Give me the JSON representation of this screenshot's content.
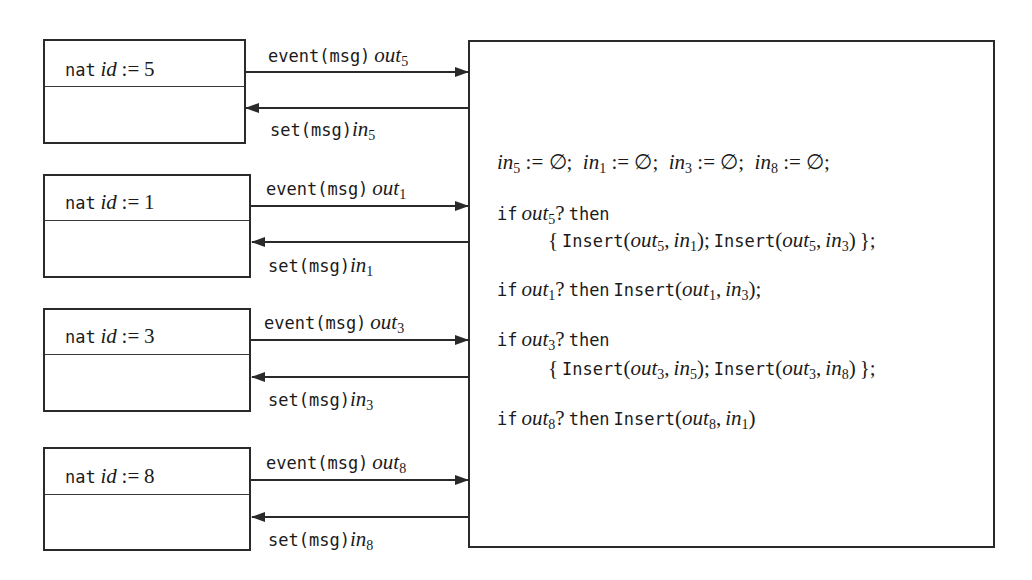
{
  "components": [
    {
      "type_kw": "nat",
      "var": "id",
      "assign": ":=",
      "value": "5",
      "event_label": "event(msg)",
      "out_var": "out",
      "out_sub": "5",
      "set_label": "set(msg)",
      "in_var": "in",
      "in_sub": "5"
    },
    {
      "type_kw": "nat",
      "var": "id",
      "assign": ":=",
      "value": "1",
      "event_label": "event(msg)",
      "out_var": "out",
      "out_sub": "1",
      "set_label": "set(msg)",
      "in_var": "in",
      "in_sub": "1"
    },
    {
      "type_kw": "nat",
      "var": "id",
      "assign": ":=",
      "value": "3",
      "event_label": "event(msg)",
      "out_var": "out",
      "out_sub": "3",
      "set_label": "set(msg)",
      "in_var": "in",
      "in_sub": "3"
    },
    {
      "type_kw": "nat",
      "var": "id",
      "assign": ":=",
      "value": "8",
      "event_label": "event(msg)",
      "out_var": "out",
      "out_sub": "8",
      "set_label": "set(msg)",
      "in_var": "in",
      "in_sub": "8"
    }
  ],
  "code": {
    "init": [
      {
        "var": "in",
        "sub": "5",
        "rest": " := ∅;  "
      },
      {
        "var": "in",
        "sub": "1",
        "rest": " := ∅;  "
      },
      {
        "var": "in",
        "sub": "3",
        "rest": " := ∅;  "
      },
      {
        "var": "in",
        "sub": "8",
        "rest": " := ∅;"
      }
    ],
    "kw_if": "if",
    "kw_then": "then",
    "kw_insert": "Insert",
    "var_out": "out",
    "var_in": "in",
    "q": "?",
    "open_brace": "{",
    "close_brace": "};",
    "semi": ";",
    "comma": ",",
    "lparen": "(",
    "rparen": ")",
    "rules": [
      {
        "out_sub": "5",
        "inserts": [
          {
            "out": "5",
            "in": "1"
          },
          {
            "out": "5",
            "in": "3"
          }
        ]
      },
      {
        "out_sub": "1",
        "inserts": [
          {
            "out": "1",
            "in": "3"
          }
        ]
      },
      {
        "out_sub": "3",
        "inserts": [
          {
            "out": "3",
            "in": "5"
          },
          {
            "out": "3",
            "in": "8"
          }
        ]
      },
      {
        "out_sub": "8",
        "inserts": [
          {
            "out": "8",
            "in": "1"
          }
        ]
      }
    ]
  }
}
